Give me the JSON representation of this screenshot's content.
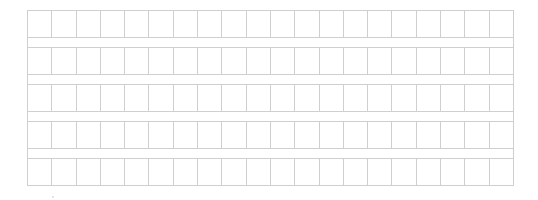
{
  "grid": {
    "rows": 5,
    "columns": 20,
    "line_color": "#cfcfcf",
    "background": "#ffffff"
  }
}
